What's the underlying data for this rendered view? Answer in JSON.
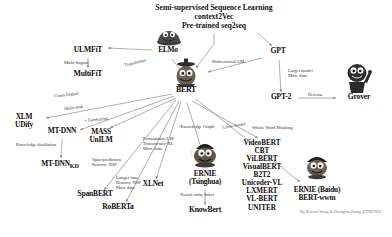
{
  "diagram": {
    "title_lines": [
      "Semi-supervised Sequence Learning",
      "context2Vec",
      "Pre-trained seq2seq"
    ],
    "credit": "By Xiaozhi Wang & Zhengyan Zhang @THUNLP",
    "colors": {
      "background": "#ffffff",
      "text": "#0d0d0d",
      "edge": "#8c8c8c",
      "edge_label": "#333333",
      "credit": "#7a7a7a",
      "elmo_body": "#4a4a4a",
      "bert_body": "#5c5245",
      "ernie_body": "#4c4438",
      "grover_body": "#2e2e2e"
    },
    "nodes": [
      {
        "id": "elmo",
        "label": "ELMo",
        "sub": "",
        "x": 168,
        "y": 52
      },
      {
        "id": "ulmfit",
        "label": "ULMFiT",
        "sub": "",
        "x": 88,
        "y": 52
      },
      {
        "id": "multifit",
        "label": "MultiFiT",
        "sub": "",
        "x": 88,
        "y": 76
      },
      {
        "id": "gpt",
        "label": "GPT",
        "sub": "",
        "x": 278,
        "y": 53
      },
      {
        "id": "gpt2",
        "label": "GPT-2",
        "sub": "",
        "x": 281,
        "y": 99
      },
      {
        "id": "grover",
        "label": "Grover",
        "sub": "",
        "x": 359,
        "y": 99
      },
      {
        "id": "bert",
        "label": "BERT",
        "sub": "",
        "x": 186,
        "y": 90
      },
      {
        "id": "xlm",
        "label": "XLM",
        "sub": "UDify",
        "x": 24,
        "y": 120
      },
      {
        "id": "mtdnn",
        "label": "MT-DNN",
        "sub": "",
        "x": 62,
        "y": 133
      },
      {
        "id": "mtdnnkd",
        "label": "MT-DNN",
        "sub": "KD",
        "x": 60,
        "y": 166
      },
      {
        "id": "massunilm",
        "label": "MASS",
        "sub": "UnILM",
        "x": 100,
        "y": 135
      },
      {
        "id": "spanbert",
        "label": "SpanBERT",
        "sub": "",
        "x": 95,
        "y": 196
      },
      {
        "id": "roberta",
        "label": "RoBERTa",
        "sub": "",
        "x": 118,
        "y": 209
      },
      {
        "id": "xlnet",
        "label": "XLNet",
        "sub": "",
        "x": 153,
        "y": 186
      },
      {
        "id": "ernie_thu",
        "label": "ERNIE",
        "sub": "(Tsinghua)",
        "x": 205,
        "y": 177
      },
      {
        "id": "knowbert",
        "label": "KnowBert",
        "sub": "",
        "x": 205,
        "y": 212
      },
      {
        "id": "ernie_baidu",
        "label": "ERNIE (Baidu)",
        "sub": "BERT-wwm",
        "x": 317,
        "y": 192
      }
    ],
    "vl_stack": {
      "id": "vl-models",
      "x": 262,
      "y": 146,
      "items": [
        "VideoBERT",
        "CBT",
        "ViLBERT",
        "VisualBERT",
        "B2T2",
        "Unicoder-VL",
        "LXMERT",
        "VL-BERT",
        "UNITER"
      ]
    },
    "edge_labels": [
      {
        "id": "multi-lingual",
        "lines": [
          "Multi-lingual"
        ],
        "x": 64,
        "y": 63,
        "rot": 0
      },
      {
        "id": "transformer",
        "lines": [
          "Transformer"
        ],
        "x": 128,
        "y": 63,
        "rot": -13
      },
      {
        "id": "bidirectional-lm",
        "lines": [
          "Bidirectional LM"
        ],
        "x": 216,
        "y": 62,
        "rot": 0
      },
      {
        "id": "larger-model",
        "lines": [
          "Larger model",
          "More data"
        ],
        "x": 292,
        "y": 72,
        "rot": 0
      },
      {
        "id": "defense",
        "lines": [
          "Defense"
        ],
        "x": 316,
        "y": 95,
        "rot": 0
      },
      {
        "id": "cross-lingual",
        "lines": [
          "Cross-lingual"
        ],
        "x": 62,
        "y": 95,
        "rot": -7
      },
      {
        "id": "multi-task",
        "lines": [
          "Multi-task"
        ],
        "x": 72,
        "y": 108,
        "rot": -7
      },
      {
        "id": "knowledge-distill",
        "lines": [
          "Knowledge distillation"
        ],
        "x": 26,
        "y": 146,
        "rot": 0
      },
      {
        "id": "generation",
        "lines": [
          "+ Generation"
        ],
        "x": 92,
        "y": 120,
        "rot": -6
      },
      {
        "id": "span-prediction",
        "lines": [
          "Span prediction",
          "Remove NSP"
        ],
        "x": 98,
        "y": 162,
        "rot": 0
      },
      {
        "id": "longer-time",
        "lines": [
          "Longer time",
          "Remove NSP",
          "More data"
        ],
        "x": 122,
        "y": 180,
        "rot": 0
      },
      {
        "id": "permutation-lm",
        "lines": [
          "Permutation LM",
          "Transformer-XL",
          "More data"
        ],
        "x": 149,
        "y": 140,
        "rot": 0
      },
      {
        "id": "knowledge-graph",
        "lines": [
          "+Knowledge Graph"
        ],
        "x": 190,
        "y": 127,
        "rot": 0
      },
      {
        "id": "neural-entity",
        "lines": [
          "Neural entity linker"
        ],
        "x": 186,
        "y": 196,
        "rot": 0
      },
      {
        "id": "cross-modal",
        "lines": [
          "Cross-modal"
        ],
        "x": 228,
        "y": 126,
        "rot": -10
      },
      {
        "id": "whole-word-masking",
        "lines": [
          "Whole Word Masking"
        ],
        "x": 262,
        "y": 128,
        "rot": 0
      }
    ]
  }
}
